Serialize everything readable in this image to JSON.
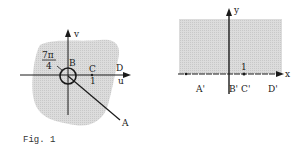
{
  "figure": {
    "caption": "Fig. 1",
    "left_plane": {
      "axes": {
        "horizontal": "u",
        "vertical": "v"
      },
      "angle_label": {
        "numerator": "7π",
        "denominator": "4"
      },
      "points": {
        "A": "A",
        "B": "B",
        "C": "C",
        "D": "D"
      },
      "tick_label": "1",
      "colors": {
        "region": "#d4d4d4",
        "ink": "#1a1a1a"
      }
    },
    "right_plane": {
      "axes": {
        "horizontal": "x",
        "vertical": "y"
      },
      "points": {
        "A": "A'",
        "B": "B'",
        "C": "C'",
        "D": "D'"
      },
      "tick_label": "1",
      "colors": {
        "region": "#d4d4d4",
        "ink": "#1a1a1a"
      }
    }
  }
}
